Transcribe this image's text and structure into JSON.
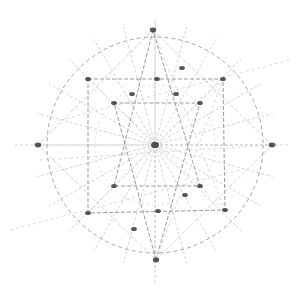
{
  "diagram": {
    "title": "Geometric star construction sketch",
    "colors": {
      "background": "#ffffff",
      "line": "#9a9a9a",
      "line_light": "#c8c8c8",
      "node": "#3a3a3a"
    },
    "center": [
      155,
      145
    ],
    "circle_radius": 108,
    "rays_count": 24,
    "nodes": [
      [
        155,
        145
      ],
      [
        153,
        30
      ],
      [
        272,
        145
      ],
      [
        38,
        145
      ],
      [
        156,
        260
      ],
      [
        88,
        79
      ],
      [
        223,
        79
      ],
      [
        88,
        213
      ],
      [
        225,
        210
      ],
      [
        114,
        103
      ],
      [
        200,
        103
      ],
      [
        114,
        186
      ],
      [
        200,
        186
      ],
      [
        182,
        68
      ],
      [
        185,
        195
      ],
      [
        134,
        229
      ],
      [
        157,
        79
      ],
      [
        158,
        211
      ],
      [
        132,
        94
      ],
      [
        176,
        94
      ]
    ],
    "polygon_square": [
      [
        88,
        79
      ],
      [
        223,
        79
      ],
      [
        225,
        210
      ],
      [
        88,
        213
      ]
    ],
    "polygon_triangle_top": [
      [
        153,
        30
      ],
      [
        114,
        186
      ],
      [
        200,
        186
      ]
    ],
    "polygon_triangle_bottom": [
      [
        156,
        260
      ],
      [
        114,
        103
      ],
      [
        200,
        103
      ]
    ],
    "diamond": [
      [
        153,
        30
      ],
      [
        272,
        145
      ],
      [
        156,
        260
      ],
      [
        38,
        145
      ]
    ]
  }
}
